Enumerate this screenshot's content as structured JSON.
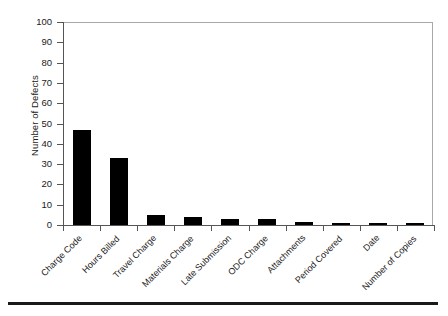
{
  "chart_data": {
    "type": "bar",
    "title": "",
    "xlabel": "",
    "ylabel": "Number of Defects",
    "ylim": [
      0,
      100
    ],
    "yticks": [
      0,
      10,
      20,
      30,
      40,
      50,
      60,
      70,
      80,
      90,
      100
    ],
    "grid": false,
    "legend": null,
    "bar_color": "#000000",
    "frame_color": "#a8a8a8",
    "axis_color": "#555555",
    "categories": [
      "Charge Code",
      "Hours Billed",
      "Travel Charge",
      "Materials Charge",
      "Late Submission",
      "ODC Charge",
      "Attachments",
      "Period Covered",
      "Date",
      "Number of Copies"
    ],
    "values": [
      47,
      33,
      5,
      4,
      3,
      3,
      1.5,
      0.7,
      0.7,
      0.7
    ]
  },
  "axis": {
    "y_title": "Number of Defects",
    "tick_labels": [
      "0",
      "10",
      "20",
      "30",
      "40",
      "50",
      "60",
      "70",
      "80",
      "90",
      "100"
    ]
  }
}
